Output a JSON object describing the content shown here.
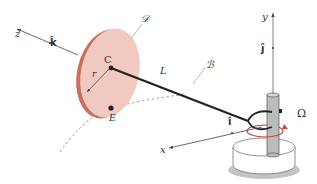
{
  "diagram": {
    "labels": {
      "z_axis": "z",
      "k_hat": "k̂",
      "y_axis": "y",
      "j_hat": "ĵ",
      "x_axis": "x",
      "i_hat": "î",
      "disk": "𝒟",
      "center": "C",
      "radius": "r",
      "rod_length": "L",
      "body": "ℬ",
      "point_e": "E",
      "omega": "Ω"
    },
    "colors": {
      "disk_face": "#f2c6bc",
      "disk_edge": "#c8705f",
      "rod": "#222222",
      "post": "#b9b9b9",
      "rotation_arrow": "#c8473a",
      "base_shadow": "#bdbdbd",
      "axis": "#444444",
      "dashed_path": "#777777"
    }
  }
}
